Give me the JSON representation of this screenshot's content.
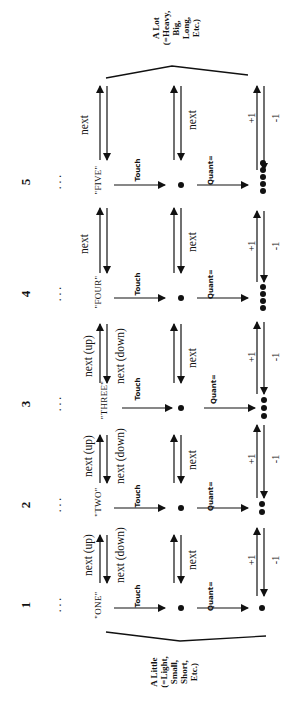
{
  "diagram": {
    "orientation": "rotated-90-ccw",
    "top_brace_label": "A Lot\n(=Heavy,\nBig,\nLong,\nEtc.)",
    "bottom_brace_label": "A Little\n(=Light,\nSmall,\nShort,\nEtc.)",
    "edge_labels": {
      "touch": "Touch",
      "quant": "Quant=",
      "next": "next",
      "next_up": "next (up)",
      "next_down": "next (down)",
      "plus_one": "+1",
      "minus_one": "-1"
    },
    "rows": [
      {
        "number": "1",
        "word": "\"ONE\"",
        "count": 1
      },
      {
        "number": "2",
        "word": "\"TWO\"",
        "count": 2
      },
      {
        "number": "3",
        "word": "\"THREE\"",
        "count": 3
      },
      {
        "number": "4",
        "word": "\"FOUR\"",
        "count": 4
      },
      {
        "number": "5",
        "word": "\"FIVE\"",
        "count": 5
      }
    ],
    "links": [
      {
        "between": "1-2",
        "left_up": "next (up)",
        "left_down": "next (down)",
        "middle": "next",
        "right_up": "+1",
        "right_down": "-1"
      },
      {
        "between": "2-3",
        "left_up": "next (up)",
        "left_down": "next (down)",
        "middle": "next",
        "right_up": "+1",
        "right_down": "-1"
      },
      {
        "between": "3-4",
        "left_up": "next (up)",
        "left_down": "next (down)",
        "middle": "next",
        "right_up": "+1",
        "right_down": "-1"
      },
      {
        "between": "4-5",
        "left_up": "next",
        "left_down": "",
        "middle": "next",
        "right_up": "+1",
        "right_down": "-1"
      },
      {
        "between": "5-above",
        "left_up": "next",
        "left_down": "",
        "middle": "next",
        "right_up": "+1",
        "right_down": "-1"
      }
    ],
    "ellipsis": ". . ."
  }
}
